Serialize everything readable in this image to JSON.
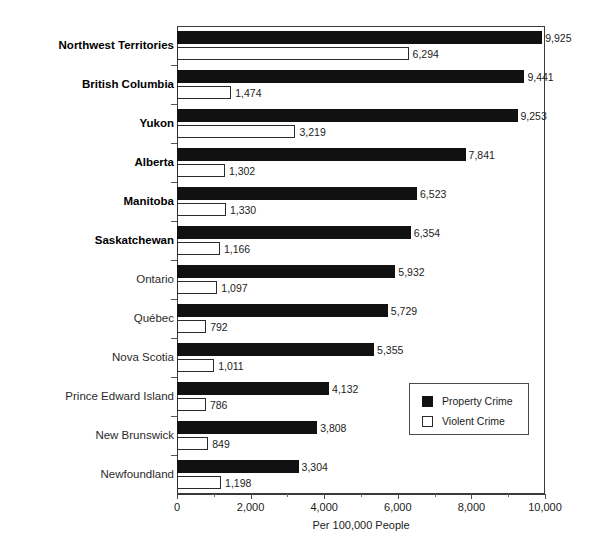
{
  "chart_data": {
    "type": "bar",
    "orientation": "horizontal",
    "title": "",
    "xlabel": "Per 100,000 People",
    "ylabel": "",
    "xlim": [
      0,
      10000
    ],
    "xticks": [
      0,
      2000,
      4000,
      6000,
      8000,
      10000
    ],
    "xtick_labels": [
      "0",
      "2,000",
      "4,000",
      "6,000",
      "8,000",
      "10,000"
    ],
    "grid": false,
    "legend_position": "middle-right",
    "categories": [
      "Northwest Territories",
      "British Columbia",
      "Yukon",
      "Alberta",
      "Manitoba",
      "Saskatchewan",
      "Ontario",
      "Québec",
      "Nova Scotia",
      "Prince Edward Island",
      "New Brunswick",
      "Newfoundland"
    ],
    "category_emphasis": [
      true,
      true,
      true,
      true,
      true,
      true,
      false,
      false,
      false,
      false,
      false,
      false
    ],
    "series": [
      {
        "name": "Property Crime",
        "color": "#111111",
        "values": [
          9925,
          9441,
          9253,
          7841,
          6523,
          6354,
          5932,
          5729,
          5355,
          4132,
          3808,
          3304
        ],
        "labels": [
          "9,925",
          "9,441",
          "9,253",
          "7,841",
          "6,523",
          "6,354",
          "5,932",
          "5,729",
          "5,355",
          "4,132",
          "3,808",
          "3,304"
        ]
      },
      {
        "name": "Violent Crime",
        "color": "#ffffff",
        "values": [
          6294,
          1474,
          3219,
          1302,
          1330,
          1166,
          1097,
          792,
          1011,
          786,
          849,
          1198
        ],
        "labels": [
          "6,294",
          "1,474",
          "3,219",
          "1,302",
          "1,330",
          "1,166",
          "1,097",
          "792",
          "1,011",
          "786",
          "849",
          "1,198"
        ]
      }
    ]
  },
  "legend": {
    "items": [
      {
        "label": "Property Crime",
        "swatch": "filled-square-icon"
      },
      {
        "label": "Violent Crime",
        "swatch": "hollow-square-icon"
      }
    ]
  }
}
